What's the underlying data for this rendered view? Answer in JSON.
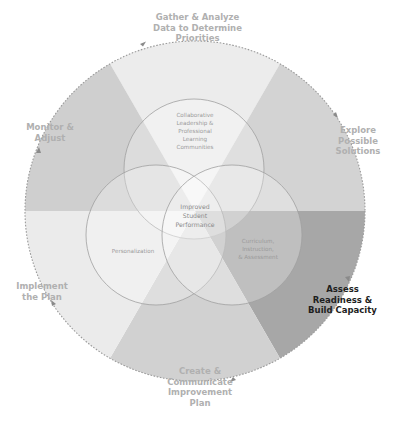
{
  "diagram": {
    "type": "cycle-venn",
    "outer_cycle": {
      "center": [
        195,
        211
      ],
      "radius": 170,
      "stages": [
        {
          "id": "gather",
          "lines": [
            "Gather & Analyze",
            "Data to Determine",
            "Priorities"
          ],
          "fill": "#ececec",
          "active": false
        },
        {
          "id": "explore",
          "lines": [
            "Explore",
            "Possible",
            "Solutions"
          ],
          "fill": "#d3d3d3",
          "active": false
        },
        {
          "id": "assess",
          "lines": [
            "Assess",
            "Readiness &",
            "Build Capacity"
          ],
          "fill": "#a7a7a7",
          "active": true
        },
        {
          "id": "create",
          "lines": [
            "Create &",
            "Communicate",
            "Improvement",
            "Plan"
          ],
          "fill": "#d1d1d1",
          "active": false
        },
        {
          "id": "implement",
          "lines": [
            "Implement",
            "the Plan"
          ],
          "fill": "#ebebeb",
          "active": false
        },
        {
          "id": "monitor",
          "lines": [
            "Monitor &",
            "Adjust"
          ],
          "fill": "#cfcfcf",
          "active": false
        }
      ],
      "border_color": "#9a9a9a",
      "arrow_color": "#8a8a8a"
    },
    "venn": {
      "circles": [
        {
          "id": "collaborative",
          "lines": [
            "Collaborative",
            "Leadership &",
            "Professional",
            "Learning",
            "Communities"
          ]
        },
        {
          "id": "personalization",
          "lines": [
            "Personalization"
          ]
        },
        {
          "id": "curriculum",
          "lines": [
            "Curriculum,",
            "Instruction,",
            "& Assessment"
          ]
        }
      ],
      "center_label": [
        "Improved",
        "Student",
        "Performance"
      ],
      "stroke_color": "#a0a0a0",
      "overlay_fill": "rgba(255,255,255,0.28)"
    }
  }
}
